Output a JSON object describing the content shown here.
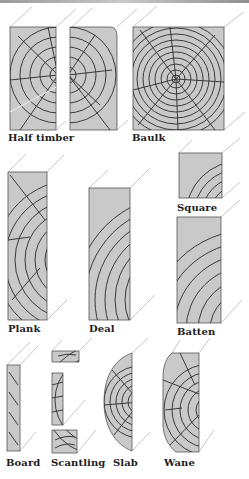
{
  "figure": {
    "colors": {
      "wood_fill": "#c9c9c9",
      "ring_stroke": "#3a3a3a",
      "guide_stroke": "#b8b8b8",
      "label": "#1d1d1d"
    },
    "sections": [
      {
        "id": "half-timber",
        "label": "Half timber"
      },
      {
        "id": "baulk",
        "label": "Baulk"
      },
      {
        "id": "square",
        "label": "Square"
      },
      {
        "id": "plank",
        "label": "Plank"
      },
      {
        "id": "deal",
        "label": "Deal"
      },
      {
        "id": "batten",
        "label": "Batten"
      },
      {
        "id": "board",
        "label": "Board"
      },
      {
        "id": "scantling",
        "label": "Scantling"
      },
      {
        "id": "slab",
        "label": "Slab"
      },
      {
        "id": "wane",
        "label": "Wane"
      }
    ]
  }
}
